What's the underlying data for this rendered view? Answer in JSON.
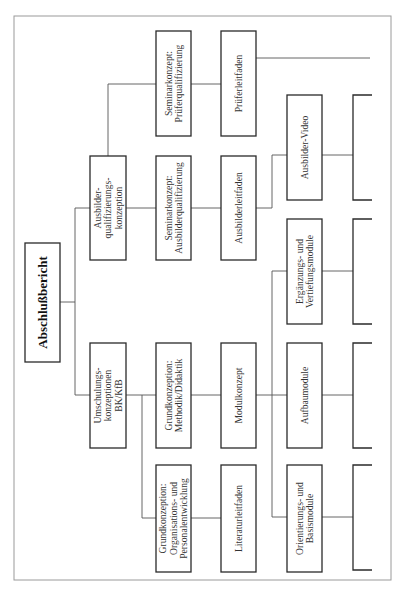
{
  "diagram": {
    "type": "tree",
    "orientation": "rotated-90-counterclockwise",
    "root": {
      "id": "abschlussbericht",
      "label": "Abschlußbericht"
    },
    "nodes": {
      "umschulung": {
        "lines": [
          "Umschulungs-",
          "konzeptionen",
          "BK/KfB"
        ]
      },
      "ausbilderquali": {
        "lines": [
          "Ausbilder-",
          "qualifizierungs-",
          "konzeption"
        ]
      },
      "sem_pruefer": {
        "lines": [
          "Seminarkonzept:",
          "Prüferqualifizierung"
        ]
      },
      "sem_ausbilder": {
        "lines": [
          "Seminarkonzept:",
          "Ausbilderqualifizierung"
        ]
      },
      "grund_methodik": {
        "lines": [
          "Grundkonzeption:",
          "Methodik/Didaktik"
        ]
      },
      "grund_orga": {
        "lines": [
          "Grundkonzeption:",
          "Organisations- und",
          "Personalentwicklung"
        ]
      },
      "prueferleitfaden": {
        "lines": [
          "Prüferleitfaden"
        ]
      },
      "ausbilderleitfaden": {
        "lines": [
          "Ausbilderleitfaden"
        ]
      },
      "modulkonzept": {
        "lines": [
          "Modulkonzept"
        ]
      },
      "literaturleitfaden": {
        "lines": [
          "Literaturleitfaden"
        ]
      },
      "ausbilder_video": {
        "lines": [
          "Ausbilder-Video"
        ]
      },
      "ergaenzung": {
        "lines": [
          "Ergänzungs- und",
          "Vertiefungsmodule"
        ]
      },
      "aufbau": {
        "lines": [
          "Aufbaumodule"
        ]
      },
      "orientierung": {
        "lines": [
          "Orientierungs- und",
          "Basismodule"
        ]
      }
    },
    "edges": [
      [
        "abschlussbericht",
        "umschulung"
      ],
      [
        "abschlussbericht",
        "ausbilderquali"
      ],
      [
        "ausbilderquali",
        "sem_pruefer"
      ],
      [
        "ausbilderquali",
        "sem_ausbilder"
      ],
      [
        "umschulung",
        "grund_methodik"
      ],
      [
        "umschulung",
        "grund_orga"
      ],
      [
        "sem_pruefer",
        "prueferleitfaden"
      ],
      [
        "sem_ausbilder",
        "ausbilderleitfaden"
      ],
      [
        "grund_methodik",
        "modulkonzept"
      ],
      [
        "grund_orga",
        "literaturleitfaden"
      ],
      [
        "ausbilderleitfaden",
        "ausbilder_video"
      ],
      [
        "modulkonzept",
        "ergaenzung"
      ],
      [
        "modulkonzept",
        "aufbau"
      ],
      [
        "modulkonzept",
        "orientierung"
      ]
    ],
    "truncated_continuations": [
      "prueferleitfaden",
      "ausbilder_video",
      "ergaenzung",
      "aufbau",
      "orientierung"
    ]
  }
}
